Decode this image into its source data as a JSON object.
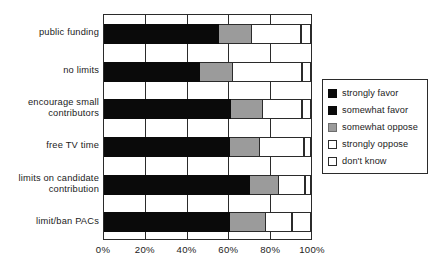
{
  "chart_data": {
    "type": "bar",
    "orientation": "horizontal",
    "stacked": true,
    "title": "",
    "subtitle": "",
    "xlabel": "",
    "ylabel": "",
    "xlim": [
      0,
      100
    ],
    "grid": true,
    "legend_position": "right",
    "categories": [
      "public funding",
      "no limits",
      "encourage small contributors",
      "free TV time",
      "limits on candidate contribution",
      "limit/ban PACs"
    ],
    "category_lines": [
      [
        "public funding"
      ],
      [
        "no limits"
      ],
      [
        "encourage small",
        "contributors"
      ],
      [
        "free TV time"
      ],
      [
        "limits on candidate",
        "contribution"
      ],
      [
        "limit/ban PACs"
      ]
    ],
    "series": [
      {
        "name": "strongly favor",
        "color": "#0a0a0a",
        "values": [
          30,
          24,
          34,
          33,
          41,
          33
        ]
      },
      {
        "name": "somewhat favor",
        "color": "#0a0a0a",
        "values": [
          26,
          23,
          27,
          28,
          30,
          28
        ]
      },
      {
        "name": "somewhat oppose",
        "color": "#9b9b9b",
        "values": [
          16,
          15,
          15,
          14,
          13,
          17
        ]
      },
      {
        "name": "strongly oppose",
        "color": "#ffffff",
        "values": [
          24,
          34,
          19,
          21,
          13,
          13
        ]
      },
      {
        "name": "don't know",
        "color": "#ffffff",
        "values": [
          5,
          5,
          4,
          4,
          3,
          9
        ]
      }
    ],
    "cumulative_boundaries_percent": [
      {
        "category": "public funding",
        "favor_end": 55.6,
        "somewhat_oppose_end": 71.1,
        "strongly_oppose_end": 95.1,
        "dont_know_end": 100
      },
      {
        "category": "no limits",
        "favor_end": 46.6,
        "somewhat_oppose_end": 61.9,
        "strongly_oppose_end": 95.5,
        "dont_know_end": 100
      },
      {
        "category": "encourage small contributors",
        "favor_end": 61.4,
        "somewhat_oppose_end": 76.2,
        "strongly_oppose_end": 95.7,
        "dont_know_end": 100
      },
      {
        "category": "free TV time",
        "favor_end": 60.8,
        "somewhat_oppose_end": 75.1,
        "strongly_oppose_end": 96.4,
        "dont_know_end": 100
      },
      {
        "category": "limits on candidate contribution",
        "favor_end": 70.7,
        "somewhat_oppose_end": 84.2,
        "strongly_oppose_end": 97.3,
        "dont_know_end": 100
      },
      {
        "category": "limit/ban PACs",
        "favor_end": 60.9,
        "somewhat_oppose_end": 77.8,
        "strongly_oppose_end": 90.9,
        "dont_know_end": 100
      }
    ],
    "xticks": [
      0,
      20,
      40,
      60,
      80,
      100
    ],
    "xtick_labels": [
      "0%",
      "20%",
      "40%",
      "60%",
      "80%",
      "100%"
    ]
  },
  "legend": {
    "items": [
      {
        "label": "strongly favor",
        "swatch": "sw-black"
      },
      {
        "label": "somewhat favor",
        "swatch": "sw-black"
      },
      {
        "label": "somewhat oppose",
        "swatch": "sw-gray"
      },
      {
        "label": "strongly oppose",
        "swatch": "sw-white"
      },
      {
        "label": "don't know",
        "swatch": "sw-white"
      }
    ]
  },
  "colors": {
    "favor": "#0a0a0a",
    "somewhat_oppose": "#9b9b9b",
    "oppose": "#ffffff",
    "axis": "#2b2b2b",
    "background": "#ffffff"
  }
}
